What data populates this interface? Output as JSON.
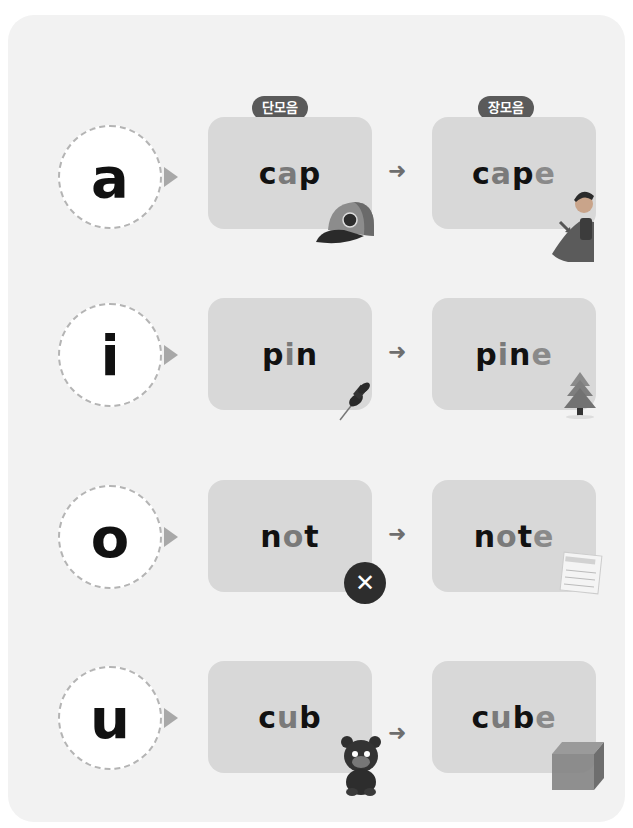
{
  "labels": {
    "short_vowel": "단모음",
    "long_vowel": "장모음"
  },
  "arrow_glyph": "➜",
  "rows": [
    {
      "vowel": "a",
      "short_word": {
        "before": "c",
        "vowel": "a",
        "after": "p"
      },
      "long_word": {
        "before": "c",
        "vowel": "a",
        "mid": "p",
        "e": "e"
      },
      "short_picture": "cap-icon",
      "long_picture": "superhero-cape-icon"
    },
    {
      "vowel": "i",
      "short_word": {
        "before": "p",
        "vowel": "i",
        "after": "n"
      },
      "long_word": {
        "before": "p",
        "vowel": "i",
        "mid": "n",
        "e": "e"
      },
      "short_picture": "pushpin-icon",
      "long_picture": "pine-tree-icon"
    },
    {
      "vowel": "o",
      "short_word": {
        "before": "n",
        "vowel": "o",
        "after": "t"
      },
      "long_word": {
        "before": "n",
        "vowel": "o",
        "mid": "t",
        "e": "e"
      },
      "short_picture": "x-mark-icon",
      "long_picture": "note-paper-icon",
      "x_glyph": "✕"
    },
    {
      "vowel": "u",
      "short_word": {
        "before": "c",
        "vowel": "u",
        "after": "b"
      },
      "long_word": {
        "before": "c",
        "vowel": "u",
        "mid": "b",
        "e": "e"
      },
      "short_picture": "bear-cub-icon",
      "long_picture": "cube-icon"
    }
  ],
  "colors": {
    "card_bg": "#f2f2f2",
    "box_bg": "#d8d8d8",
    "tag_bg": "#5a5a5a",
    "vowel_text": "#7a7a7a",
    "consonant_text": "#111111"
  }
}
